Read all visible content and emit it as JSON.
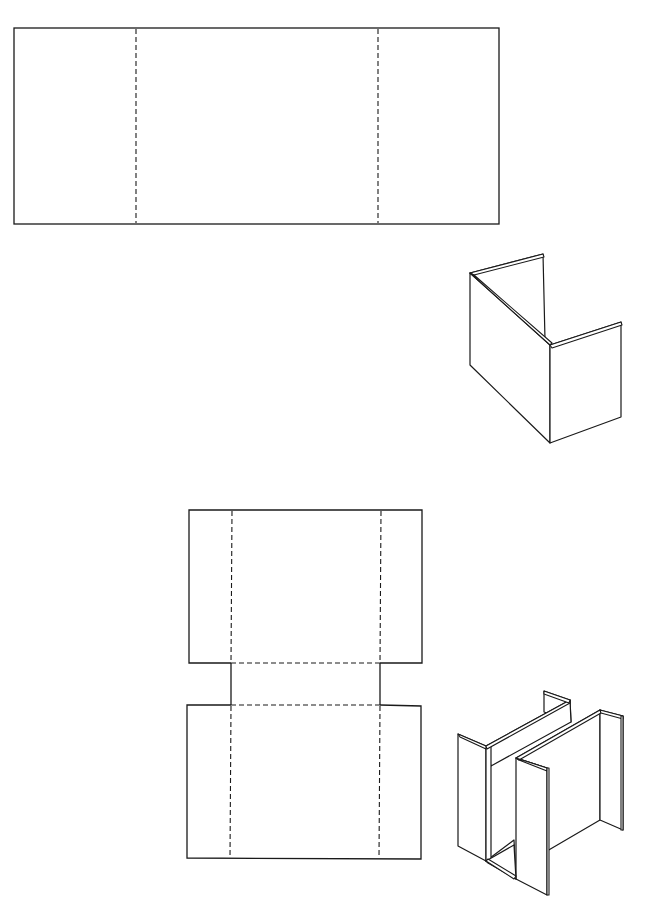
{
  "figure": {
    "line_color": "#1a1a1a",
    "background": "#ffffff",
    "line_styles": {
      "cut_line": "solid",
      "fold_line": "dashed"
    },
    "items": [
      {
        "id": "net-1",
        "kind": "flat-net",
        "panels": 3,
        "fold_lines": 2,
        "fold_orientation": "vertical"
      },
      {
        "id": "folded-1",
        "kind": "folded-shape",
        "shape": "U-channel",
        "panels": 3
      },
      {
        "id": "net-2",
        "kind": "flat-net",
        "panels": "two rectangles joined by a narrow connector strip",
        "fold_lines": 4,
        "fold_orientation": "vertical and horizontal"
      },
      {
        "id": "folded-2",
        "kind": "folded-shape",
        "shape": "H-channel / double-U",
        "panels": 7
      }
    ]
  }
}
